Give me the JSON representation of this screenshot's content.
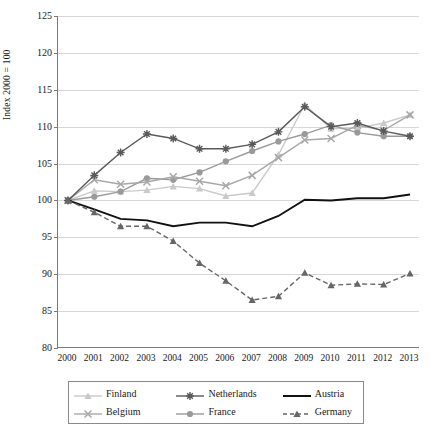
{
  "axis": {
    "ylabel": "Index 2000 = 100",
    "yticks": [
      125,
      120,
      115,
      110,
      105,
      100,
      95,
      90,
      85,
      80
    ],
    "ymin": 80,
    "ymax": 125
  },
  "legend": {
    "items": [
      {
        "name": "Finland",
        "marker": "triangle-marker",
        "color": "#c9c9c9",
        "dash": "solid"
      },
      {
        "name": "Netherlands",
        "marker": "star-marker",
        "color": "#5a5a5a",
        "dash": "solid"
      },
      {
        "name": "Austria",
        "marker": "none",
        "color": "#111111",
        "dash": "solid"
      },
      {
        "name": "Belgium",
        "marker": "x-marker",
        "color": "#a8a8a8",
        "dash": "solid"
      },
      {
        "name": "France",
        "marker": "circle-marker",
        "color": "#9a9a9a",
        "dash": "solid"
      },
      {
        "name": "Germany",
        "marker": "triangle-marker",
        "color": "#666666",
        "dash": "dashed"
      }
    ]
  },
  "chart_data": {
    "type": "line",
    "title": "",
    "xlabel": "",
    "ylabel": "Index 2000 = 100",
    "ylim": [
      80,
      125
    ],
    "grid": true,
    "legend_position": "bottom",
    "categories": [
      "2000",
      "2001",
      "2002",
      "2003",
      "2004",
      "2005",
      "2006",
      "2007",
      "2008",
      "2009",
      "2010",
      "2011",
      "2012",
      "2013"
    ],
    "series": [
      {
        "name": "Finland",
        "color": "#c9c9c9",
        "marker": "triangle",
        "dash": "solid",
        "values": [
          100,
          101.3,
          101.2,
          101.4,
          101.9,
          101.6,
          100.6,
          101.0,
          106.2,
          113.0,
          109.7,
          109.8,
          110.5,
          111.6
        ]
      },
      {
        "name": "Netherlands",
        "color": "#5a5a5a",
        "marker": "star",
        "dash": "solid",
        "values": [
          100,
          103.4,
          106.5,
          109.0,
          108.4,
          107.0,
          107.0,
          107.6,
          109.3,
          112.7,
          110.0,
          110.5,
          109.4,
          108.7
        ]
      },
      {
        "name": "Austria",
        "color": "#111111",
        "marker": "none",
        "dash": "solid",
        "values": [
          100,
          98.8,
          97.5,
          97.3,
          96.5,
          97.0,
          97.0,
          96.5,
          97.9,
          100.1,
          100.0,
          100.3,
          100.3,
          100.8
        ]
      },
      {
        "name": "Belgium",
        "color": "#a8a8a8",
        "marker": "x",
        "dash": "solid",
        "values": [
          100,
          102.8,
          102.2,
          102.5,
          103.2,
          102.6,
          102.0,
          103.4,
          105.8,
          108.2,
          108.4,
          110.2,
          109.5,
          111.6
        ]
      },
      {
        "name": "France",
        "color": "#9a9a9a",
        "marker": "circle",
        "dash": "solid",
        "values": [
          100,
          100.5,
          101.2,
          103.0,
          102.8,
          103.8,
          105.3,
          106.7,
          108.0,
          109.0,
          110.2,
          109.2,
          108.7,
          108.7
        ]
      },
      {
        "name": "Germany",
        "color": "#666666",
        "marker": "triangle",
        "dash": "dashed",
        "values": [
          100,
          98.4,
          96.5,
          96.5,
          94.5,
          91.5,
          89.1,
          86.5,
          87.0,
          90.2,
          88.5,
          88.7,
          88.6,
          90.1
        ]
      }
    ]
  }
}
